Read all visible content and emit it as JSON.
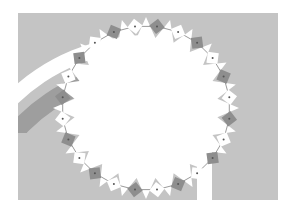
{
  "figure": {
    "width": 291,
    "height": 216,
    "background": "#ffffff",
    "panel": {
      "x": 18,
      "y": 13,
      "w": 260,
      "h": 187,
      "color": "#c4c4c4"
    },
    "arc_white_band": {
      "cx": 150,
      "cy": 240,
      "r_outer": 205,
      "r_inner": 190,
      "color": "#ffffff"
    },
    "arc_dark_band": {
      "cx": 150,
      "cy": 250,
      "r_outer": 188,
      "r_inner": 170,
      "color": "#9e9e9e"
    },
    "arc_clip": {
      "x": 18,
      "y": 13,
      "w": 120,
      "h": 120
    },
    "gap_bar": {
      "x": 197,
      "y": 150,
      "w": 15,
      "h": 50,
      "color": "#ffffff"
    },
    "star": {
      "cx": 146,
      "cy": 108,
      "points": 24,
      "r_outer": 93,
      "r_inner": 72,
      "rx_scale": 1.0,
      "ry_scale": 0.98,
      "fill": "#ffffff"
    },
    "teeth": {
      "count": 24,
      "size": 11,
      "radius": 84,
      "dark_color": "#8e8e8e",
      "light_color": "#ffffff",
      "line_color": "#555555",
      "dot_color": "#555555"
    }
  }
}
